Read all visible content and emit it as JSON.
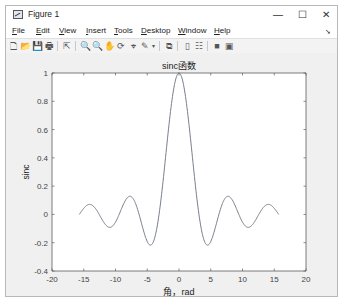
{
  "window": {
    "title": "Figure 1",
    "controls": {
      "minimize": "—",
      "maximize": "☐",
      "close": "✕"
    }
  },
  "menu": {
    "items": [
      {
        "label": "File",
        "mnemonic": "F",
        "rest": "ile"
      },
      {
        "label": "Edit",
        "mnemonic": "E",
        "rest": "dit"
      },
      {
        "label": "View",
        "mnemonic": "V",
        "rest": "iew"
      },
      {
        "label": "Insert",
        "mnemonic": "I",
        "rest": "nsert"
      },
      {
        "label": "Tools",
        "mnemonic": "T",
        "rest": "ools"
      },
      {
        "label": "Desktop",
        "mnemonic": "D",
        "rest": "esktop"
      },
      {
        "label": "Window",
        "mnemonic": "W",
        "rest": "indow"
      },
      {
        "label": "Help",
        "mnemonic": "H",
        "rest": "elp"
      }
    ],
    "overflow_arrow": "➘"
  },
  "toolbar": {
    "icons": [
      {
        "name": "new-figure-icon",
        "glyph": "🗋"
      },
      {
        "name": "open-file-icon",
        "glyph": "📂"
      },
      {
        "name": "save-icon",
        "glyph": "💾"
      },
      {
        "name": "print-icon",
        "glyph": "🖶"
      },
      {
        "name": "edit-plot-icon",
        "glyph": "⇱"
      },
      {
        "name": "zoom-in-icon",
        "glyph": "🔍"
      },
      {
        "name": "zoom-out-icon",
        "glyph": "🔍"
      },
      {
        "name": "pan-icon",
        "glyph": "✋"
      },
      {
        "name": "rotate-3d-icon",
        "glyph": "⟳"
      },
      {
        "name": "data-cursor-icon",
        "glyph": "⌖"
      },
      {
        "name": "brush-icon",
        "glyph": "✎"
      },
      {
        "name": "link-plot-icon",
        "glyph": "⧉"
      },
      {
        "name": "insert-colorbar-icon",
        "glyph": "▯"
      },
      {
        "name": "insert-legend-icon",
        "glyph": "☷"
      },
      {
        "name": "hide-plot-tools-icon",
        "glyph": "■"
      },
      {
        "name": "show-plot-tools-icon",
        "glyph": "▣"
      }
    ]
  },
  "chart_data": {
    "type": "line",
    "title": "sinc函数",
    "xlabel": "角，rad",
    "ylabel": "sinc",
    "xlim": [
      -20,
      20
    ],
    "ylim": [
      -0.4,
      1
    ],
    "xticks": [
      -20,
      -15,
      -10,
      -5,
      0,
      5,
      10,
      15,
      20
    ],
    "yticks": [
      -0.4,
      -0.2,
      0,
      0.2,
      0.4,
      0.6,
      0.8,
      1
    ],
    "ytick_labels": [
      "-0.4",
      "-0.2",
      "0",
      "0.2",
      "0.4",
      "0.6",
      "0.8",
      "1"
    ],
    "grid": false,
    "legend": null,
    "line_color": "#7a7f8c",
    "series": [
      {
        "name": "sinc",
        "x": [
          -15.7,
          -15,
          -14.07,
          -13,
          -12,
          -10.9,
          -10,
          -9,
          -8,
          -7.73,
          -7,
          -6,
          -5,
          -4.49,
          -4,
          -3,
          -2,
          -1,
          0,
          1,
          2,
          3,
          4,
          4.49,
          5,
          6,
          7,
          7.73,
          8,
          9,
          10,
          10.9,
          12,
          13,
          14.07,
          15,
          15.7
        ],
        "y": [
          0.0,
          0.043,
          0.071,
          0.032,
          -0.045,
          -0.091,
          -0.054,
          0.046,
          0.124,
          0.128,
          0.094,
          -0.047,
          -0.192,
          -0.217,
          -0.189,
          0.047,
          0.455,
          0.841,
          1.0,
          0.841,
          0.455,
          0.047,
          -0.189,
          -0.217,
          -0.192,
          -0.047,
          0.094,
          0.128,
          0.124,
          0.046,
          -0.054,
          -0.091,
          -0.045,
          0.032,
          0.071,
          0.043,
          0.0
        ]
      }
    ]
  }
}
